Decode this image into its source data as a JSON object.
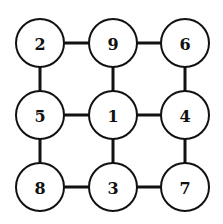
{
  "diagram": {
    "type": "grid-graph",
    "radius": 24,
    "columns_x": [
      40,
      113,
      185
    ],
    "rows_y": [
      43,
      115,
      187
    ],
    "nodes": [
      {
        "id": "n00",
        "label": "2",
        "row": 0,
        "col": 0
      },
      {
        "id": "n01",
        "label": "9",
        "row": 0,
        "col": 1
      },
      {
        "id": "n02",
        "label": "6",
        "row": 0,
        "col": 2
      },
      {
        "id": "n10",
        "label": "5",
        "row": 1,
        "col": 0
      },
      {
        "id": "n11",
        "label": "1",
        "row": 1,
        "col": 1
      },
      {
        "id": "n12",
        "label": "4",
        "row": 1,
        "col": 2
      },
      {
        "id": "n20",
        "label": "8",
        "row": 2,
        "col": 0
      },
      {
        "id": "n21",
        "label": "3",
        "row": 2,
        "col": 1
      },
      {
        "id": "n22",
        "label": "7",
        "row": 2,
        "col": 2
      }
    ],
    "edges": [
      [
        "n00",
        "n01"
      ],
      [
        "n01",
        "n02"
      ],
      [
        "n10",
        "n11"
      ],
      [
        "n11",
        "n12"
      ],
      [
        "n20",
        "n21"
      ],
      [
        "n21",
        "n22"
      ],
      [
        "n00",
        "n10"
      ],
      [
        "n10",
        "n20"
      ],
      [
        "n01",
        "n11"
      ],
      [
        "n11",
        "n21"
      ],
      [
        "n02",
        "n12"
      ],
      [
        "n12",
        "n22"
      ]
    ]
  }
}
